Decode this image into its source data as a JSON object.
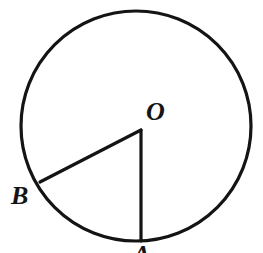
{
  "figure": {
    "kind": "circle-with-central-angle",
    "background_color": "#ffffff",
    "stroke_color": "#141414",
    "label_color": "#141414",
    "canvas": {
      "width": 263,
      "height": 253
    },
    "circle": {
      "name": "circle-outline",
      "center_x": 136,
      "center_y": 126,
      "radius": 115,
      "stroke_width": 3.2
    },
    "center_point": {
      "x": 141,
      "y": 130
    },
    "radii": [
      {
        "name": "radius-OB",
        "from_x": 141,
        "from_y": 130,
        "to_x": 40,
        "to_y": 182,
        "stroke_width": 3.2
      },
      {
        "name": "radius-OA",
        "from_x": 141,
        "from_y": 130,
        "to_x": 141,
        "to_y": 241,
        "stroke_width": 3.2
      }
    ],
    "labels": {
      "center": "O",
      "point_b": "B",
      "point_a": "A"
    }
  }
}
